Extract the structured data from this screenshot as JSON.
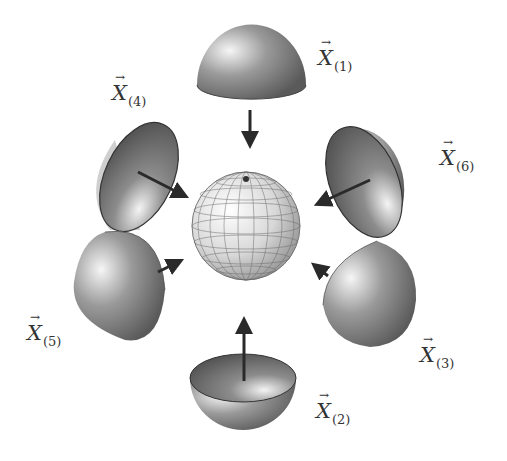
{
  "diagram": {
    "type": "sphere assembled from six hemisphere pieces",
    "center": {
      "name": "grid-sphere",
      "description": "wireframe sphere with latitude/longitude grid"
    },
    "pieces": [
      {
        "id": 1,
        "label": "X",
        "subscript": "(1)",
        "position": "top",
        "arrow_direction": "down"
      },
      {
        "id": 2,
        "label": "X",
        "subscript": "(2)",
        "position": "bottom",
        "arrow_direction": "up"
      },
      {
        "id": 3,
        "label": "X",
        "subscript": "(3)",
        "position": "bottom-right",
        "arrow_direction": "up-left"
      },
      {
        "id": 4,
        "label": "X",
        "subscript": "(4)",
        "position": "top-left",
        "arrow_direction": "down-right"
      },
      {
        "id": 5,
        "label": "X",
        "subscript": "(5)",
        "position": "bottom-left",
        "arrow_direction": "up-right"
      },
      {
        "id": 6,
        "label": "X",
        "subscript": "(6)",
        "position": "top-right",
        "arrow_direction": "down-left"
      }
    ],
    "colors": {
      "shell_dark": "#5e5e5e",
      "shell_light": "#f2f2f2",
      "arrow": "#2a2a2a",
      "grid": "#555555"
    }
  }
}
